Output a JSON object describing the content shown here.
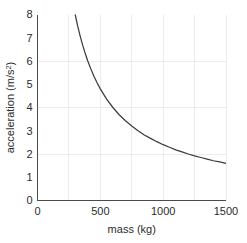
{
  "chart_data": {
    "type": "line",
    "title": "",
    "subtitle": "",
    "xlabel": "mass (kg)",
    "ylabel": "acceleration (m/s²)",
    "ylabel_base": "acceleration (m/s",
    "ylabel_sup": "2",
    "ylabel_close": ")",
    "xlim": [
      0,
      1500
    ],
    "ylim": [
      0,
      8
    ],
    "grid": true,
    "legend": null,
    "legend_position": "none",
    "x_ticks": [
      0,
      500,
      1000,
      1500
    ],
    "x_tick_labels": [
      "0",
      "500",
      "1000",
      "1500"
    ],
    "y_ticks": [
      0,
      1,
      2,
      3,
      4,
      5,
      6,
      7,
      8
    ],
    "y_tick_labels": [
      "0",
      "1",
      "2",
      "3",
      "4",
      "5",
      "6",
      "7",
      "8"
    ],
    "x_minor_gridlines": [
      250,
      500,
      750,
      1000,
      1250
    ],
    "y_minor_gridlines": [
      2,
      4,
      6
    ],
    "relationship": "a = 2400 / m",
    "curve_color": "#3c3c3c",
    "axis_color": "#4a4a4a",
    "grid_color": "#ececed",
    "background_color": "#ffffff",
    "series": [
      {
        "name": "acceleration vs mass",
        "x": [
          300,
          320,
          340,
          360,
          380,
          400,
          425,
          450,
          475,
          500,
          550,
          600,
          650,
          700,
          750,
          800,
          850,
          900,
          950,
          1000,
          1050,
          1100,
          1150,
          1200,
          1250,
          1300,
          1350,
          1400,
          1450,
          1500
        ],
        "values": [
          8.0,
          7.5,
          7.06,
          6.67,
          6.32,
          6.0,
          5.65,
          5.33,
          5.05,
          4.8,
          4.36,
          4.0,
          3.69,
          3.43,
          3.2,
          3.0,
          2.82,
          2.67,
          2.53,
          2.4,
          2.29,
          2.18,
          2.09,
          2.0,
          1.92,
          1.85,
          1.78,
          1.71,
          1.66,
          1.6
        ]
      }
    ]
  }
}
